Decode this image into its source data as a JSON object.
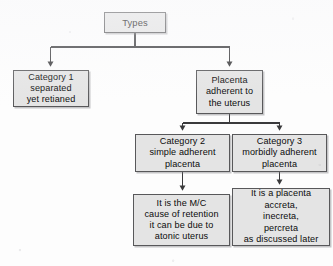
{
  "diagram": {
    "title": "Types",
    "background_color": "#fdfdfd",
    "node_fill_color": "#e4e4e4",
    "node_border_color": "#58585a",
    "text_color": "#0b0b0b",
    "connector_color": "#3a3a3c"
  },
  "nodes": {
    "types": {
      "label": "Types",
      "lines": [
        "Types"
      ]
    },
    "category_1": {
      "label": "Category 1 separated yet retianed",
      "lines": [
        "Category 1",
        "separated",
        "yet retianed"
      ]
    },
    "placenta_adherent": {
      "label": "Placenta adherent to the uterus",
      "lines": [
        "Placenta",
        "adherent to",
        "the uterus"
      ]
    },
    "category_2": {
      "label": "Category 2 simple adherent placenta",
      "lines": [
        "Category 2",
        "simple adherent",
        "placenta"
      ]
    },
    "category_3": {
      "label": "Category 3 morbidly adherent placenta",
      "lines": [
        "Category 3",
        "morbidly adherent",
        "placenta"
      ]
    },
    "detail_2": {
      "label": "It is the M/C cause of retention it can be due to atonic uterus",
      "lines": [
        "It is the M/C",
        "cause of retention",
        "it can be due to",
        "atonic uterus"
      ]
    },
    "detail_3": {
      "label": "It is a placenta accreta, inecreta, percreta as discussed later",
      "lines": [
        "It is a placenta",
        "accreta,",
        "inecreta,",
        "percreta",
        "as discussed later"
      ]
    }
  },
  "edges": [
    {
      "from": "types",
      "to": "category_1",
      "arrow": true
    },
    {
      "from": "types",
      "to": "placenta_adherent",
      "arrow": true
    },
    {
      "from": "placenta_adherent",
      "to": "category_2",
      "arrow": true
    },
    {
      "from": "placenta_adherent",
      "to": "category_3",
      "arrow": true
    },
    {
      "from": "category_2",
      "to": "detail_2",
      "arrow": true
    },
    {
      "from": "category_3",
      "to": "detail_3",
      "arrow": true
    }
  ]
}
